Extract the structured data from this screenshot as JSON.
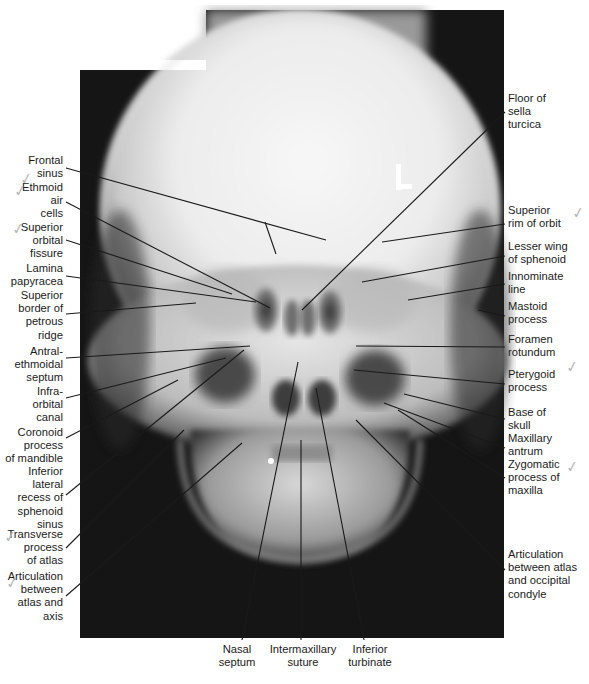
{
  "figure": {
    "type": "PA radiograph of skull with anatomical labels"
  },
  "labels_left": [
    {
      "id": "frontal-sinus",
      "text": "Frontal\nsinus",
      "x": 8,
      "y": 179,
      "w": 55
    },
    {
      "id": "ethmoid-air-cells",
      "text": "Ethmoid\nair\ncells",
      "x": 8,
      "y": 185,
      "w": 55
    },
    {
      "id": "superior-orbital-fissure",
      "text": "Superior\norbital\nfissure",
      "x": 8,
      "y": 222,
      "w": 55
    },
    {
      "id": "lamina-papyracea",
      "text": "Lamina\npapyracea",
      "x": 8,
      "y": 262,
      "w": 55
    },
    {
      "id": "superior-border-petrous-ridge",
      "text": "Superior\nborder of\npetrous\nridge",
      "x": 8,
      "y": 290,
      "w": 55
    },
    {
      "id": "antral-ethmoidal-septum",
      "text": "Antral-\nethmoidal\nseptum",
      "x": 8,
      "y": 345,
      "w": 55
    },
    {
      "id": "infraorbital-canal",
      "text": "Infra-\norbital\ncanal",
      "x": 8,
      "y": 385,
      "w": 55
    },
    {
      "id": "coronoid-process-mandible",
      "text": "Coronoid\nprocess\nof mandible",
      "x": 0,
      "y": 425,
      "w": 63
    },
    {
      "id": "inferior-lateral-recess-sphenoid-sinus",
      "text": "Inferior\nlateral\nrecess of\nsphenoid\nsinus",
      "x": 8,
      "y": 465,
      "w": 55
    },
    {
      "id": "transverse-process-atlas",
      "text": "Transverse\nprocess\nof atlas",
      "x": 4,
      "y": 530,
      "w": 59
    },
    {
      "id": "articulation-atlas-axis",
      "text": "Articulation\nbetween\natlas and\naxis",
      "x": 0,
      "y": 570,
      "w": 63
    }
  ],
  "labels_right": [
    {
      "id": "floor-sella-turcica",
      "text": "Floor of\nsella\nturcica",
      "x": 508,
      "y": 92
    },
    {
      "id": "superior-rim-orbit",
      "text": "Superior\nrim of orbit",
      "x": 508,
      "y": 204
    },
    {
      "id": "lesser-wing-sphenoid",
      "text": "Lesser wing\nof sphenoid",
      "x": 508,
      "y": 240
    },
    {
      "id": "innominate-line",
      "text": "Innominate\nline",
      "x": 508,
      "y": 270
    },
    {
      "id": "mastoid-process",
      "text": "Mastoid\nprocess",
      "x": 508,
      "y": 300
    },
    {
      "id": "foramen-rotundum",
      "text": "Foramen\nrotundum",
      "x": 508,
      "y": 333
    },
    {
      "id": "pterygoid-process",
      "text": "Pterygoid\nprocess",
      "x": 508,
      "y": 368
    },
    {
      "id": "base-of-skull",
      "text": "Base of\nskull",
      "x": 508,
      "y": 406
    },
    {
      "id": "maxillary-antrum",
      "text": "Maxillary\nantrum",
      "x": 508,
      "y": 432
    },
    {
      "id": "zygomatic-process-maxilla",
      "text": "Zygomatic\nprocess of\nmaxilla",
      "x": 508,
      "y": 458
    },
    {
      "id": "articulation-atlas-occipital-condyle",
      "text": "Articulation\nbetween atlas\nand occipital\ncondyle",
      "x": 508,
      "y": 548
    }
  ],
  "labels_bottom": [
    {
      "id": "nasal-septum",
      "text": "Nasal\nseptum",
      "x": 212,
      "y": 643,
      "w": 50
    },
    {
      "id": "intermaxillary-suture",
      "text": "Intermaxillary\nsuture",
      "x": 258,
      "y": 643,
      "w": 90
    },
    {
      "id": "inferior-turbinate",
      "text": "Inferior\nturbinate",
      "x": 340,
      "y": 643,
      "w": 60
    }
  ],
  "leader_lines": [
    {
      "for": "frontal-sinus",
      "x1": 66,
      "y1": 168,
      "x2": 326,
      "y2": 240
    },
    {
      "for": "frontal-sinus-branch",
      "x1": 265,
      "y1": 222,
      "x2": 276,
      "y2": 254
    },
    {
      "for": "ethmoid-air-cells",
      "x1": 66,
      "y1": 202,
      "x2": 270,
      "y2": 308
    },
    {
      "for": "superior-orbital-fissure",
      "x1": 66,
      "y1": 240,
      "x2": 232,
      "y2": 294
    },
    {
      "for": "lamina-papyracea",
      "x1": 66,
      "y1": 276,
      "x2": 256,
      "y2": 302
    },
    {
      "for": "superior-border-petrous-ridge",
      "x1": 66,
      "y1": 314,
      "x2": 196,
      "y2": 303
    },
    {
      "for": "antral-ethmoidal-septum",
      "x1": 66,
      "y1": 358,
      "x2": 250,
      "y2": 346
    },
    {
      "for": "infraorbital-canal",
      "x1": 66,
      "y1": 398,
      "x2": 226,
      "y2": 358
    },
    {
      "for": "coronoid-process-mandible",
      "x1": 66,
      "y1": 438,
      "x2": 178,
      "y2": 380
    },
    {
      "for": "inferior-lateral-recess-sphenoid-sinus",
      "x1": 66,
      "y1": 495,
      "x2": 244,
      "y2": 350
    },
    {
      "for": "transverse-process-atlas",
      "x1": 66,
      "y1": 548,
      "x2": 184,
      "y2": 430
    },
    {
      "for": "articulation-atlas-axis",
      "x1": 66,
      "y1": 596,
      "x2": 242,
      "y2": 443
    },
    {
      "for": "floor-sella-turcica",
      "x1": 505,
      "y1": 112,
      "x2": 302,
      "y2": 310
    },
    {
      "for": "superior-rim-orbit",
      "x1": 505,
      "y1": 224,
      "x2": 382,
      "y2": 242
    },
    {
      "for": "lesser-wing-sphenoid",
      "x1": 505,
      "y1": 256,
      "x2": 362,
      "y2": 282
    },
    {
      "for": "innominate-line",
      "x1": 505,
      "y1": 284,
      "x2": 408,
      "y2": 300
    },
    {
      "for": "mastoid-process",
      "x1": 505,
      "y1": 316,
      "x2": 478,
      "y2": 310
    },
    {
      "for": "foramen-rotundum",
      "x1": 505,
      "y1": 347,
      "x2": 356,
      "y2": 346
    },
    {
      "for": "pterygoid-process",
      "x1": 505,
      "y1": 384,
      "x2": 354,
      "y2": 370
    },
    {
      "for": "base-of-skull",
      "x1": 505,
      "y1": 419,
      "x2": 404,
      "y2": 394
    },
    {
      "for": "maxillary-antrum",
      "x1": 505,
      "y1": 448,
      "x2": 384,
      "y2": 403
    },
    {
      "for": "zygomatic-process-maxilla",
      "x1": 505,
      "y1": 478,
      "x2": 398,
      "y2": 410
    },
    {
      "for": "articulation-atlas-occipital-condyle",
      "x1": 505,
      "y1": 570,
      "x2": 356,
      "y2": 420
    },
    {
      "for": "nasal-septum",
      "x1": 242,
      "y1": 640,
      "x2": 298,
      "y2": 362
    },
    {
      "for": "intermaxillary-suture",
      "x1": 301,
      "y1": 640,
      "x2": 301,
      "y2": 440
    },
    {
      "for": "inferior-turbinate",
      "x1": 364,
      "y1": 640,
      "x2": 316,
      "y2": 388
    }
  ],
  "checkmarks": [
    {
      "x": 20,
      "y": 170
    },
    {
      "x": 14,
      "y": 182
    },
    {
      "x": 12,
      "y": 220
    },
    {
      "x": 572,
      "y": 204
    },
    {
      "x": 566,
      "y": 358
    },
    {
      "x": 566,
      "y": 458
    },
    {
      "x": 4,
      "y": 528
    },
    {
      "x": 6,
      "y": 574
    }
  ],
  "colors": {
    "background": "#ffffff",
    "film_dark": "#151515",
    "bone_bright": "#f2f2f2",
    "label_text": "#1b1b1b",
    "leader_line": "#1a1a1a"
  }
}
